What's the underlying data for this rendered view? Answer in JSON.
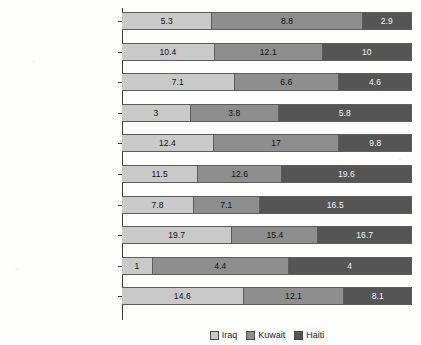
{
  "chart_data": {
    "type": "bar",
    "subtype": "100% stacked horizontal bar",
    "title": "",
    "xlabel": "",
    "ylabel": "",
    "orientation": "horizontal",
    "stacked": true,
    "normalized": true,
    "grid": false,
    "legend_position": "bottom-center",
    "axis_ticks_visible": false,
    "categories": [
      "I'm not sure",
      "No chance",
      "Slight possibility",
      "Fair possibiilty",
      "Good possibility",
      "Very probably",
      "Certain",
      "I plan to leave the service",
      "I plan to retire",
      "I do not wish to retrain\nanother skill"
    ],
    "series": [
      {
        "name": "Iraq",
        "color": "#c9c9c9",
        "values": [
          5.3,
          10.4,
          7.1,
          3,
          12.4,
          11.5,
          7.8,
          19.7,
          1,
          14.6
        ]
      },
      {
        "name": "Kuwait",
        "color": "#8e8e8e",
        "values": [
          8.8,
          12.1,
          6.6,
          3.8,
          17,
          12.6,
          7.1,
          15.4,
          4.4,
          12.1
        ]
      },
      {
        "name": "Haiti",
        "color": "#555555",
        "values": [
          2.9,
          10,
          4.6,
          5.8,
          9.8,
          19.6,
          16.5,
          16.7,
          4,
          8.1
        ]
      }
    ],
    "data_labels": [
      [
        "5.3",
        "8.8",
        "2.9"
      ],
      [
        "10.4",
        "12.1",
        "10"
      ],
      [
        "7.1",
        "6.6",
        "4.6"
      ],
      [
        "3",
        "3.8",
        "5.8"
      ],
      [
        "12.4",
        "17",
        "9.8"
      ],
      [
        "11.5",
        "12.6",
        "19.6"
      ],
      [
        "7.8",
        "7.1",
        "16.5"
      ],
      [
        "19.7",
        "15.4",
        "16.7"
      ],
      [
        "1",
        "4.4",
        "4"
      ],
      [
        "14.6",
        "12.1",
        "8.1"
      ]
    ]
  },
  "legend": {
    "items": [
      {
        "label": "Iraq",
        "color": "#c9c9c9"
      },
      {
        "label": "Kuwait",
        "color": "#8e8e8e"
      },
      {
        "label": "Haiti",
        "color": "#555555"
      }
    ]
  }
}
